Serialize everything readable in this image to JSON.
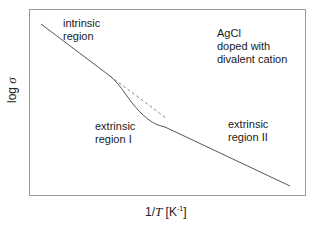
{
  "diagram": {
    "frame_color": "#9a9a9a",
    "line_color": "#555555",
    "dashed_color": "#888888",
    "labels": {
      "intrinsic": "intrinsic\nregion",
      "sample": "AgCl\ndoped with\ndivalent cation",
      "extrinsic1": "extrinsic\nregion I",
      "extrinsic2": "extrinsic\nregion II"
    },
    "y_axis": {
      "prefix": "log ",
      "symbol": "σ"
    },
    "x_axis": {
      "prefix": "1/",
      "symbol": "T",
      "unit_open": " [K",
      "unit_exp": "-1",
      "unit_close": "]"
    }
  }
}
